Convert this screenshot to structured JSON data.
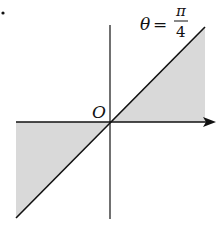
{
  "diagram": {
    "type": "polar-region",
    "origin_label": "O",
    "angle_label": {
      "variable": "θ",
      "equals": "=",
      "numerator": "π",
      "denominator": "4"
    },
    "colors": {
      "line": "#111111",
      "shade": "#d9d9d9",
      "background": "#ffffff"
    },
    "regions": [
      {
        "name": "upper-right",
        "description": "between polar axis and line θ=π/4, first quadrant"
      },
      {
        "name": "lower-left",
        "description": "between negative x-axis and line θ=π/4 extended, third quadrant"
      }
    ]
  }
}
